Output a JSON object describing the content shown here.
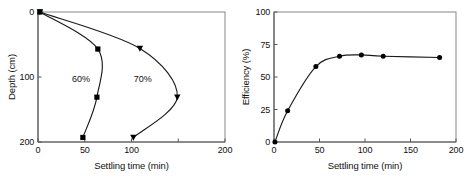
{
  "figure": {
    "background": "#ffffff",
    "axis_color": "#7a7a7a",
    "curve_color": "#1a1a1a",
    "marker_color": "#000000"
  },
  "chart_data": [
    {
      "type": "line",
      "panel": "left",
      "title": "",
      "xlabel": "Settling time (min)",
      "ylabel": "Depth (cm)",
      "xlim": [
        0,
        200
      ],
      "ylim": [
        0,
        200
      ],
      "y_inverted": true,
      "grid": false,
      "legend": "inline-annotations",
      "xticks": [
        0,
        50,
        100,
        150,
        200
      ],
      "xticklabels": [
        "0",
        "50",
        "100",
        "",
        "200"
      ],
      "yticks": [
        0,
        100,
        200
      ],
      "yticklabels": [
        "0",
        "100",
        "200"
      ],
      "annotations": [
        {
          "text": "60%",
          "x": 46,
          "y": 103
        },
        {
          "text": "70%",
          "x": 112,
          "y": 103
        }
      ],
      "series": [
        {
          "name": "60%",
          "marker": "square",
          "x": [
            2,
            64,
            63,
            48
          ],
          "y": [
            0,
            57,
            131,
            193
          ]
        },
        {
          "name": "70%",
          "marker": "triangle-down",
          "x": [
            2,
            109,
            149,
            102
          ],
          "y": [
            0,
            56,
            131,
            193
          ]
        }
      ]
    },
    {
      "type": "line",
      "panel": "right",
      "title": "",
      "xlabel": "Settling time (min)",
      "ylabel": "Efficiency (%)",
      "xlim": [
        0,
        200
      ],
      "ylim": [
        0,
        100
      ],
      "y_inverted": false,
      "grid": false,
      "legend": "none",
      "xticks": [
        0,
        50,
        100,
        150,
        200
      ],
      "xticklabels": [
        "0",
        "50",
        "100",
        "150",
        "200"
      ],
      "yticks": [
        0,
        25,
        50,
        75,
        100
      ],
      "yticklabels": [
        "0",
        "25",
        "50",
        "75",
        "100"
      ],
      "annotations": [],
      "series": [
        {
          "name": "Efficiency",
          "marker": "circle",
          "x": [
            1,
            15,
            46,
            72,
            96,
            120,
            182
          ],
          "y": [
            0,
            24,
            58,
            66,
            67,
            66,
            65
          ]
        }
      ]
    }
  ]
}
